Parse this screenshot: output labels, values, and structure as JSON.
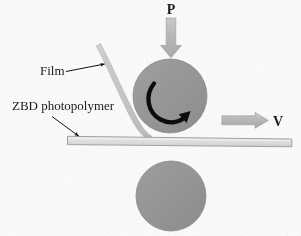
{
  "figure": {
    "background_color": "#fefefe"
  },
  "labels": {
    "pressure": "P",
    "velocity": "V",
    "film": "Film",
    "substrate": "ZBD photopolymer"
  },
  "colors": {
    "roller_fill": "#9a9a9a",
    "roller_edge": "#8c8c8c",
    "arrow_fill": "#b9b9b9",
    "arrow_edge": "#a6a6a6",
    "film_fill": "#c9c9c9",
    "substrate_fill": "#e4e4e2",
    "substrate_edge": "#9d9d9d",
    "leader_line": "#111111",
    "text": "#1b1b1b"
  },
  "elements": {
    "upper_roller": {
      "name": "upper-roller",
      "center_x": 170,
      "center_y": 96,
      "radius": 37
    },
    "lower_roller": {
      "name": "lower-roller",
      "center_x": 171,
      "center_y": 196,
      "radius": 35
    },
    "rotation_arrow": {
      "name": "rotation-arrow",
      "direction": "clockwise"
    },
    "pressure_arrow": {
      "name": "pressure-arrow",
      "direction": "down",
      "x": 171,
      "y_start": 18,
      "y_end": 57
    },
    "velocity_arrow": {
      "name": "velocity-arrow",
      "direction": "right",
      "x_start": 222,
      "x_end": 268,
      "y": 120
    },
    "film_strip": {
      "name": "film-strip",
      "top_x": 103,
      "top_y": 44,
      "nip_x": 150,
      "nip_y": 135
    },
    "substrate_bar": {
      "name": "substrate-bar",
      "x_start": 67,
      "x_end": 292,
      "y": 140,
      "thickness": 8
    }
  }
}
